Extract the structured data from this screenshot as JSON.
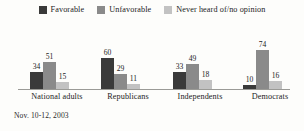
{
  "chart_data": {
    "type": "bar",
    "title": "",
    "subtitle": "",
    "xlabel": "",
    "ylabel": "",
    "ylim": [
      0,
      80
    ],
    "grid": false,
    "legend_position": "top-center",
    "categories": [
      "National adults",
      "Republicans",
      "Independents",
      "Democrats"
    ],
    "series": [
      {
        "name": "Favorable",
        "color": "#3a3a3a",
        "values": [
          34,
          60,
          33,
          10
        ]
      },
      {
        "name": "Unfavorable",
        "color": "#8a8a8a",
        "values": [
          51,
          29,
          49,
          74
        ]
      },
      {
        "name": "Never heard of/no opinion",
        "color": "#c2c2c2",
        "values": [
          15,
          11,
          18,
          16
        ]
      }
    ],
    "value_labels": [
      [
        34,
        51,
        15
      ],
      [
        60,
        29,
        11
      ],
      [
        33,
        49,
        18
      ],
      [
        10,
        74,
        16
      ]
    ],
    "annotation": "Nov. 10-12, 2003"
  },
  "legend": {
    "items": [
      {
        "label": "Favorable",
        "color": "#3a3a3a"
      },
      {
        "label": "Unfavorable",
        "color": "#8a8a8a"
      },
      {
        "label": "Never heard of/no opinion",
        "color": "#c2c2c2"
      }
    ]
  },
  "footnote": "Nov. 10-12, 2003"
}
